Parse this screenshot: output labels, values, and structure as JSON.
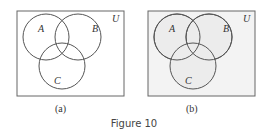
{
  "figure": {
    "caption": "Figure 10",
    "panels": [
      {
        "label": "(a)",
        "universe": "U",
        "sets": [
          "A",
          "B",
          "C"
        ],
        "shaded": false
      },
      {
        "label": "(b)",
        "universe": "U",
        "sets": [
          "A",
          "B",
          "C"
        ],
        "shaded": true
      }
    ]
  },
  "colors": {
    "line": "#555555",
    "shade": "#ececec",
    "shade_dark": "#dcdcdc"
  }
}
